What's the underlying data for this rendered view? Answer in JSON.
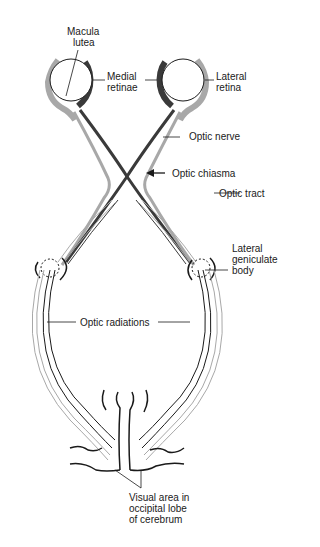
{
  "diagram": {
    "labels": {
      "macula_lutea": [
        "Macula",
        "lutea"
      ],
      "medial_retinae": [
        "Medial",
        "retinae"
      ],
      "lateral_retina": [
        "Lateral",
        "retina"
      ],
      "optic_nerve": "Optic nerve",
      "optic_chiasma": "Optic chiasma",
      "optic_tract": "Optic tract",
      "lateral_geniculate_body": [
        "Lateral",
        "geniculate",
        "body"
      ],
      "optic_radiations": "Optic radiations",
      "visual_area": [
        "Visual area in",
        "occipital lobe",
        "of cerebrum"
      ]
    },
    "colors": {
      "medial_fibers": "#3a3a3a",
      "lateral_fibers": "#a8a8a8",
      "outline": "#1a1a1a",
      "background": "#ffffff"
    }
  }
}
